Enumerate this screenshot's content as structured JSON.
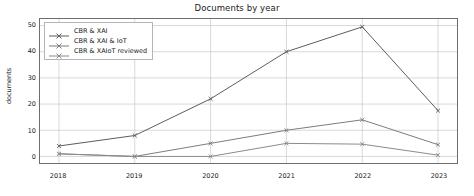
{
  "chart_data": {
    "type": "line",
    "title": "Documents by year",
    "xlabel": "",
    "ylabel": "documents",
    "categories": [
      "2018",
      "2019",
      "2020",
      "2021",
      "2022",
      "2023"
    ],
    "x": [
      2018,
      2019,
      2020,
      2021,
      2022,
      2023
    ],
    "series": [
      {
        "name": "CBR & XAI",
        "values": [
          4,
          8,
          22,
          40,
          49.5,
          17.5
        ],
        "color": "#5a5a5a",
        "marker": "x"
      },
      {
        "name": "CBR & XAI & IoT",
        "values": [
          1,
          0,
          5,
          10,
          14,
          4.5
        ],
        "color": "#7a7a7a",
        "marker": "x"
      },
      {
        "name": "CBR & XAIoT reviewed",
        "values": [
          1,
          0,
          0,
          5,
          4.7,
          0.5
        ],
        "color": "#8a8a8a",
        "marker": "x"
      }
    ],
    "ylim": [
      -2.5,
      52.5
    ],
    "yticks": [
      0,
      10,
      20,
      30,
      40,
      50
    ],
    "ytick_labels": [
      "0",
      "10",
      "20",
      "30",
      "40",
      "50"
    ],
    "xlim": [
      2017.75,
      2023.25
    ],
    "grid": true,
    "grid_color": "#c8c8c8",
    "legend_position": "upper left",
    "axes_color": "#6e6e6e",
    "background": "#ffffff"
  }
}
